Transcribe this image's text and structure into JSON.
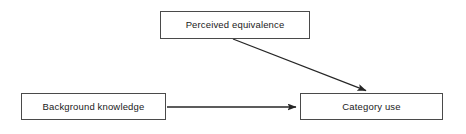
{
  "diagram": {
    "type": "flow-diagram",
    "background_color": "#ffffff",
    "line_color": "#333333",
    "box_border_color": "#4a4a4a",
    "text_color": "#1a1a1a",
    "nodes": [
      {
        "id": "perceived-equivalence",
        "label": "Perceived equivalence",
        "shape": "rectangle",
        "x": 160,
        "y": 11,
        "width": 150,
        "height": 28
      },
      {
        "id": "background-knowledge",
        "label": "Background knowledge",
        "shape": "rectangle",
        "x": 21,
        "y": 93,
        "width": 145,
        "height": 27
      },
      {
        "id": "category-use",
        "label": "Category use",
        "shape": "rectangle",
        "x": 300,
        "y": 93,
        "width": 143,
        "height": 27
      }
    ],
    "edges": [
      {
        "id": "edge-perceived-equivalence-to-category-use",
        "from": "perceived-equivalence",
        "to": "category-use",
        "style": "solid",
        "arrowhead": "filled-triangle",
        "orientation": "diagonal",
        "x1": 233,
        "y1": 39,
        "x2": 369,
        "y2": 92
      },
      {
        "id": "edge-background-knowledge-to-category-use",
        "from": "background-knowledge",
        "to": "category-use",
        "style": "solid",
        "arrowhead": "filled-triangle",
        "orientation": "horizontal",
        "x1": 167,
        "y1": 107,
        "x2": 299,
        "y2": 107
      }
    ]
  }
}
